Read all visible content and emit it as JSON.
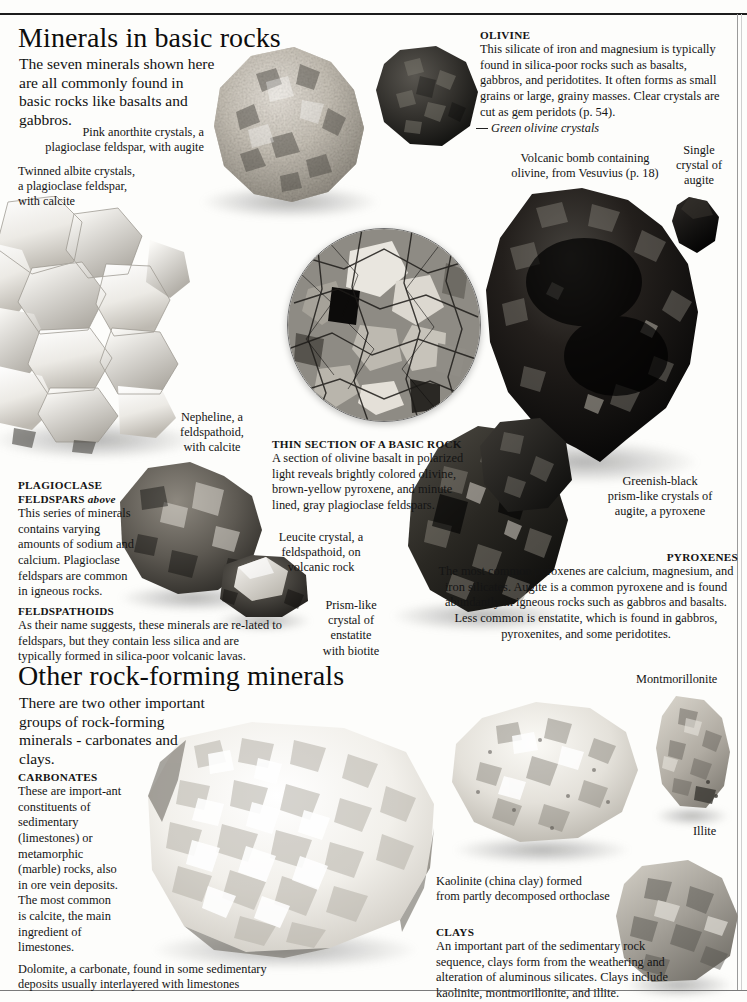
{
  "page": {
    "background_color": "#fdfdfb",
    "rule_color": "#1c1c1c"
  },
  "sections": [
    {
      "id": "basic-rocks",
      "heading": "Minerals in basic rocks",
      "intro": "The seven minerals shown here are all commonly found in basic rocks like basalts and gabbros."
    },
    {
      "id": "other-minerals",
      "heading": "Other rock-forming minerals",
      "intro": "There are two other important groups of rock-forming minerals - carbonates and clays."
    }
  ],
  "info_blocks": [
    {
      "id": "olivine",
      "title": "OLIVINE",
      "title_suffix": "",
      "body": "This silicate of iron and magnesium is typically found in silica-poor rocks such as basalts, gabbros, and peridotites. It often forms as small grains or large, grainy masses. Clear crystals are cut as gem peridots (p. 54)."
    },
    {
      "id": "plagioclase-feldspars",
      "title": "PLAGIOCLASE FELDSPARS",
      "title_suffix": "above",
      "body": "This series of minerals contains varying amounts of sodium and calcium. Plagioclase feldspars are common in igneous rocks."
    },
    {
      "id": "feldspathoids",
      "title": "FELDSPATHOIDS",
      "title_suffix": "",
      "body": "As their name suggests, these minerals are re-lated to feldspars, but they contain less silica and are typically formed in silica-poor volcanic lavas."
    },
    {
      "id": "thin-section",
      "title": "THIN SECTION OF A BASIC ROCK",
      "title_suffix": "",
      "body": "A section of olivine basalt in polarized light reveals brightly colored olivine, brown-yellow pyroxene, and minute lined, gray plagioclase feldspars."
    },
    {
      "id": "pyroxenes",
      "title": "PYROXENES",
      "title_suffix": "",
      "body": "The most common pyroxenes are calcium, magnesium, and iron silicates. Augite is a common pyroxene and is found abundantly in igneous rocks such as gabbros and basalts. Less common is enstatite, which is found in gabbros, pyroxenites, and some peridotites."
    },
    {
      "id": "carbonates",
      "title": "CARBONATES",
      "title_suffix": "",
      "body": "These are import-ant constituents of sedimentary (limestones) or metamorphic (marble) rocks, also in ore vein deposits. The most common is calcite, the main ingredient of limestones."
    },
    {
      "id": "clays",
      "title": "CLAYS",
      "title_suffix": "",
      "body": "An important part of the sedimentary rock sequence, clays form from the weathering and alteration of aluminous silicates. Clays include kaolinite, montmorillonite, and illite."
    }
  ],
  "captions": {
    "anorthite": "Pink anorthite crystals, a\nplagioclase feldspar, with augite",
    "albite": "Twinned albite crystals,\na plagioclase feldspar,\nwith calcite",
    "green_olivine": "Green olivine crystals",
    "volcanic_bomb": "Volcanic bomb containing\nolivine, from Vesuvius (p. 18)",
    "single_augite": "Single\ncrystal of\naugite",
    "nepheline": "Nepheline, a\nfeldspathoid,\nwith calcite",
    "leucite": "Leucite crystal, a\nfeldspathoid, on\nvolcanic rock",
    "enstatite": "Prism-like\ncrystal of\nenstatite\nwith biotite",
    "augite_prisms": "Greenish-black\nprism-like crystals of\naugite, a pyroxene",
    "montmorillonite": "Montmorillonite",
    "illite": "Illite",
    "kaolinite": "Kaolinite (china clay) formed\nfrom partly decomposed orthoclase",
    "dolomite": "Dolomite, a carbonate, found in some sedimentary\ndeposits usually interlayered with limestones"
  },
  "specimens": [
    {
      "id": "anorthite-rock",
      "name": "pink-anorthite-specimen"
    },
    {
      "id": "albite-cluster",
      "name": "twinned-albite-specimen"
    },
    {
      "id": "olivine-rock",
      "name": "green-olivine-specimen"
    },
    {
      "id": "volcanic-bomb",
      "name": "volcanic-bomb-specimen"
    },
    {
      "id": "augite-crystal",
      "name": "single-augite-crystal"
    },
    {
      "id": "thin-section",
      "name": "thin-section-photomicrograph"
    },
    {
      "id": "nepheline-rock",
      "name": "nepheline-specimen"
    },
    {
      "id": "leucite-rock",
      "name": "leucite-specimen"
    },
    {
      "id": "enstatite-rock",
      "name": "enstatite-specimen"
    },
    {
      "id": "augite-prisms",
      "name": "augite-prism-specimen"
    },
    {
      "id": "dolomite-rock",
      "name": "dolomite-specimen"
    },
    {
      "id": "kaolinite-rock",
      "name": "kaolinite-specimen"
    },
    {
      "id": "montmorillonite-rock",
      "name": "montmorillonite-specimen"
    },
    {
      "id": "illite-rock",
      "name": "illite-specimen"
    }
  ]
}
